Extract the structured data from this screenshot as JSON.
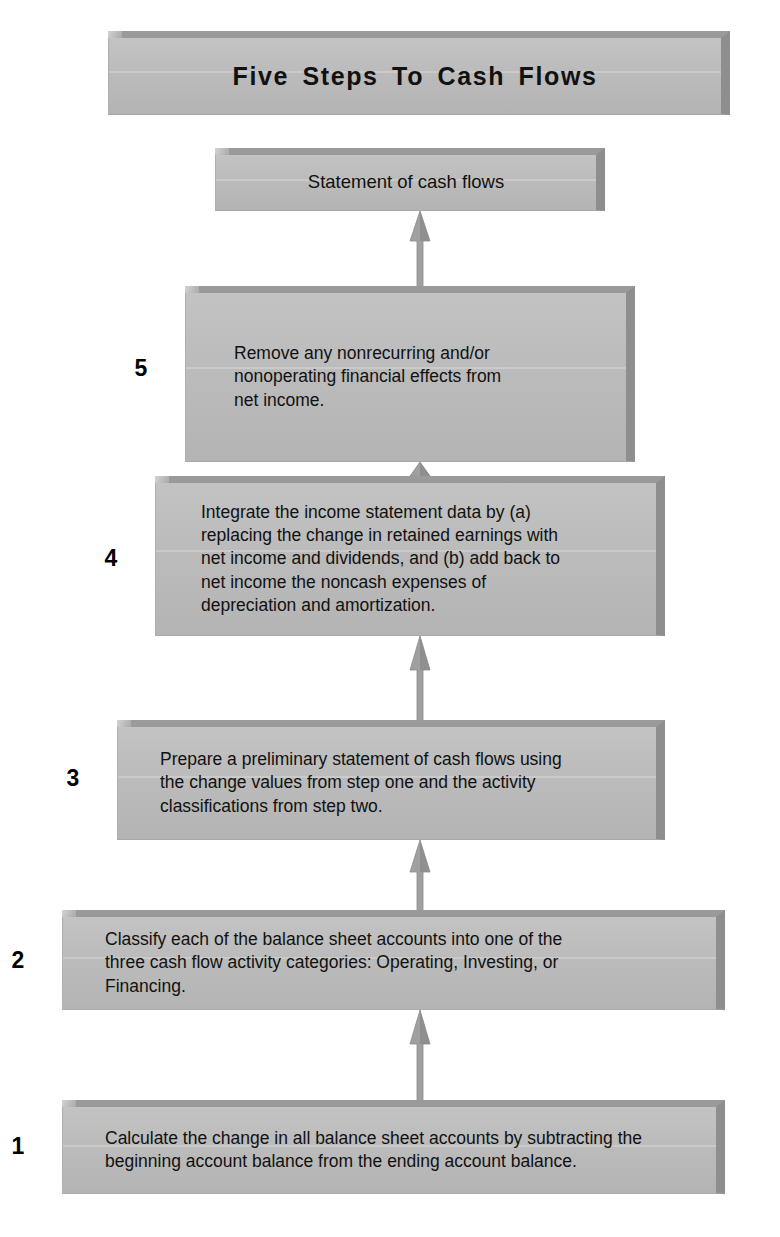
{
  "title": {
    "text": "Five Steps To Cash Flows"
  },
  "result": {
    "label": "Statement of cash flows"
  },
  "steps": [
    {
      "number": "1",
      "text": "Calculate the change in all balance sheet accounts by subtracting the\nbeginning account balance from the ending account balance."
    },
    {
      "number": "2",
      "text": "Classify each of the balance sheet accounts into one of the\nthree cash flow activity categories: Operating, Investing, or\nFinancing."
    },
    {
      "number": "3",
      "text": "Prepare a preliminary statement of cash flows using\nthe change values from step one and the activity\nclassifications from step two."
    },
    {
      "number": "4",
      "text": "Integrate the income statement data by (a)\nreplacing the change in retained earnings with\nnet income and dividends, and (b) add back to\nnet income the noncash expenses of\ndepreciation and amortization."
    },
    {
      "number": "5",
      "text": "Remove any nonrecurring and/or\nnonoperating financial effects from\nnet income."
    }
  ],
  "colors": {
    "box_face": "#bcbcbc",
    "box_bevel_top": "#9a9a9a",
    "box_bevel_right": "#8e8e8e",
    "arrow": "#9e9e9e",
    "text": "#111111",
    "background": "#ffffff"
  },
  "flow_direction": "bottom-to-top"
}
